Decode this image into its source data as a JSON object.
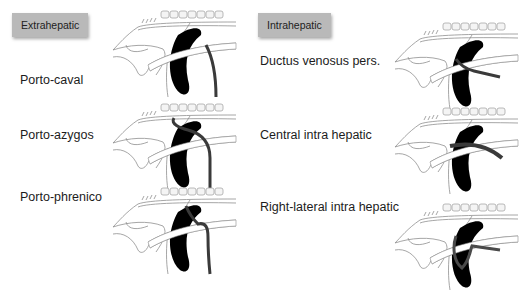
{
  "sections": [
    {
      "heading": "Extrahepatic",
      "items": [
        {
          "label": "Porto-caval",
          "shunt": "caval"
        },
        {
          "label": "Porto-azygos",
          "shunt": "azygos"
        },
        {
          "label": "Porto-phrenico",
          "shunt": "phrenico"
        }
      ]
    },
    {
      "heading": "Intrahepatic",
      "items": [
        {
          "label": "Ductus venosus pers.",
          "shunt": "ductus"
        },
        {
          "label": "Central intra hepatic",
          "shunt": "central"
        },
        {
          "label": "Right-lateral intra hepatic",
          "shunt": "rightlateral"
        }
      ]
    }
  ],
  "colors": {
    "badge": "#b9b9b9",
    "liver": "#000000",
    "shunt": "#3a3a3a",
    "vessel_outline": "#9a9a9a",
    "vertebrae": "#bcbcbc"
  }
}
